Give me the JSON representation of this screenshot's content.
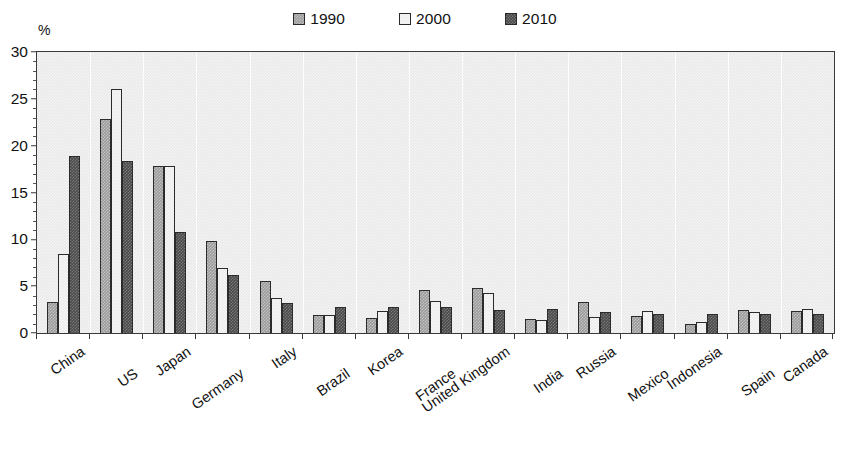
{
  "chart_data": {
    "type": "bar",
    "title": "",
    "subtitle": "",
    "xlabel": "",
    "ylabel": "%",
    "ylim": [
      0,
      30
    ],
    "y_ticks": [
      0,
      5,
      10,
      15,
      20,
      25,
      30
    ],
    "y_minor_step": 1,
    "grid": true,
    "grid_axis": "x",
    "legend_position": "top-center",
    "categories": [
      "China",
      "US",
      "Japan",
      "Germany",
      "Italy",
      "Brazil",
      "Korea",
      "France",
      "United Kingdom",
      "India",
      "Russia",
      "Mexico",
      "Indonesia",
      "Spain",
      "Canada"
    ],
    "series": [
      {
        "name": "1990",
        "color": "#9b9b9b",
        "values": [
          3.3,
          22.9,
          17.8,
          9.8,
          5.5,
          1.9,
          1.6,
          4.6,
          4.8,
          1.5,
          3.3,
          1.8,
          1.0,
          2.5,
          2.4
        ]
      },
      {
        "name": "2000",
        "color": "#ececec",
        "values": [
          8.4,
          26.1,
          17.8,
          6.9,
          3.7,
          1.9,
          2.4,
          3.4,
          4.3,
          1.4,
          1.7,
          2.3,
          1.2,
          2.2,
          2.6
        ]
      },
      {
        "name": "2010",
        "color": "#4a4a4a",
        "values": [
          18.9,
          18.4,
          10.8,
          6.2,
          3.2,
          2.8,
          2.8,
          2.8,
          2.5,
          2.6,
          2.2,
          2.0,
          2.0,
          2.0,
          2.0
        ]
      }
    ]
  },
  "legend": {
    "entries": [
      {
        "label": "1990",
        "swatch": "legend-swatch-1990"
      },
      {
        "label": "2000",
        "swatch": "legend-swatch-2000"
      },
      {
        "label": "2010",
        "swatch": "legend-swatch-2010"
      }
    ]
  },
  "axis": {
    "y_unit": "%"
  }
}
